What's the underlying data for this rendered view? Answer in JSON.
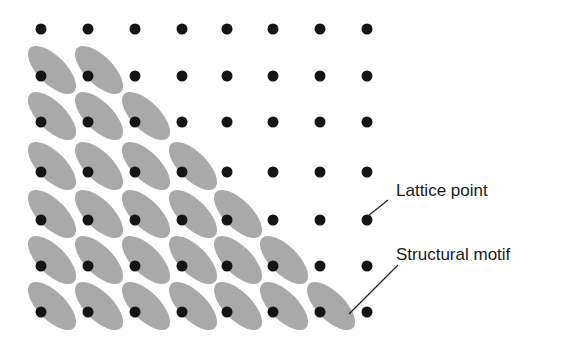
{
  "diagram": {
    "lattice": {
      "columns_x": [
        41,
        88,
        135,
        182,
        227,
        273,
        320,
        367
      ],
      "rows_y": [
        29,
        76,
        122,
        172,
        220,
        266,
        312
      ],
      "point_radius": 5.5,
      "point_color": "#141414"
    },
    "motif": {
      "color": "#a9a9a9",
      "rx": 31,
      "ry": 14,
      "rotation_deg": 45,
      "offset_x": 11,
      "offset_y": -6,
      "count_per_row": [
        0,
        2,
        3,
        4,
        5,
        6,
        7
      ]
    },
    "labels": [
      {
        "text": "Lattice point",
        "x": 396,
        "y": 181,
        "line": [
          368,
          216,
          388,
          200
        ]
      },
      {
        "text": "Structural motif",
        "x": 396,
        "y": 245,
        "line": [
          349,
          314,
          398,
          265
        ]
      }
    ],
    "line_color": "#222222"
  }
}
